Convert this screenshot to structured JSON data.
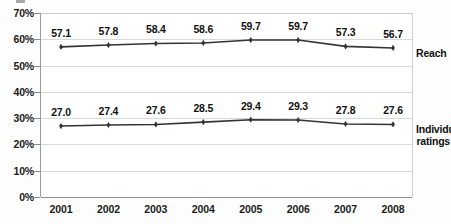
{
  "chart_data": {
    "type": "line",
    "title": "",
    "xlabel": "",
    "ylabel": "",
    "categories": [
      "2001",
      "2002",
      "2003",
      "2004",
      "2005",
      "2006",
      "2007",
      "2008"
    ],
    "ylim": [
      0,
      70
    ],
    "y_ticks": [
      "0%",
      "10%",
      "20%",
      "30%",
      "40%",
      "50%",
      "60%",
      "70%"
    ],
    "y_tick_values": [
      0,
      10,
      20,
      30,
      40,
      50,
      60,
      70
    ],
    "grid": true,
    "legend_position": "right-inline",
    "series": [
      {
        "name": "Reach",
        "values": [
          57.1,
          57.8,
          58.4,
          58.6,
          59.7,
          59.7,
          57.3,
          56.7
        ],
        "labels": [
          "57.1",
          "57.8",
          "58.4",
          "58.6",
          "59.7",
          "59.7",
          "57.3",
          "56.7"
        ],
        "color": "#333333",
        "marker": "diamond"
      },
      {
        "name": "Individual ratings",
        "name_line1": "Individual",
        "name_line2": "ratings",
        "values": [
          27.0,
          27.4,
          27.6,
          28.5,
          29.4,
          29.3,
          27.8,
          27.6
        ],
        "labels": [
          "27.0",
          "27.4",
          "27.6",
          "28.5",
          "29.4",
          "29.3",
          "27.8",
          "27.6"
        ],
        "color": "#333333",
        "marker": "diamond"
      }
    ],
    "colors": {
      "line": "#333333",
      "gridline": "#d9d9d9",
      "axis": "#8f8f8f",
      "text": "#111111",
      "background": "#ffffff"
    }
  }
}
